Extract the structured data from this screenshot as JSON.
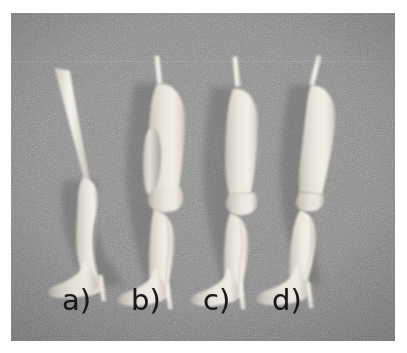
{
  "figure": {
    "kind": "photograph",
    "background_color": "#888888",
    "plate_border_color": "#ffffff",
    "specimen_color": "#e8e4dc",
    "caption_color": "#191919",
    "specimen_count": 4
  },
  "captions": [
    {
      "id": "a",
      "label": "a)"
    },
    {
      "id": "b",
      "label": "b)"
    },
    {
      "id": "c",
      "label": "c)"
    },
    {
      "id": "d",
      "label": "d)"
    }
  ],
  "specimens": [
    {
      "id": "a",
      "label": "a)",
      "description": "thin vertical support rod with only the lower leg, ankle and foot attached; no thigh or calf bulk",
      "has_top_rod": true,
      "has_heel_pin": true,
      "has_thigh": false,
      "has_knee": false,
      "has_flap": false
    },
    {
      "id": "b",
      "label": "b)",
      "description": "full leg with bulky thigh, a separate teardrop-shaped muscle flap laid on the outer thigh, knee, calf and foot",
      "has_top_rod": true,
      "has_heel_pin": true,
      "has_thigh": true,
      "has_knee": true,
      "has_flap": true
    },
    {
      "id": "c",
      "label": "c)",
      "description": "full leg with smooth tapered thigh, a distinct narrow knee joint, calf and foot",
      "has_top_rod": true,
      "has_heel_pin": true,
      "has_thigh": true,
      "has_knee": true,
      "has_flap": false
    },
    {
      "id": "d",
      "label": "d)",
      "description": "full leg with continuous smooth thigh blending into calf, slight knee crease, and foot",
      "has_top_rod": true,
      "has_heel_pin": true,
      "has_thigh": true,
      "has_knee": true,
      "has_flap": false
    }
  ]
}
